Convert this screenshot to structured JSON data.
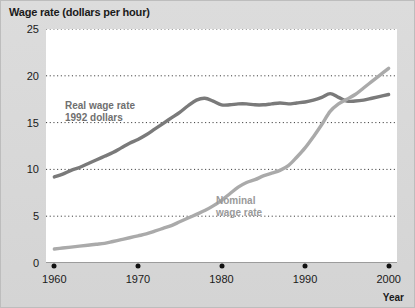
{
  "chart_data": {
    "type": "line",
    "title": "Wage rate (dollars per hour)",
    "xlabel": "Year",
    "ylabel": "Wage rate (dollars per hour)",
    "xlim": [
      1959,
      2001
    ],
    "ylim": [
      0,
      25
    ],
    "grid": true,
    "legend_position": "inline-annotations",
    "yticks": [
      0,
      5,
      10,
      15,
      20,
      25
    ],
    "ytick_labels": [
      "0",
      "5",
      "10",
      "15",
      "20",
      "25"
    ],
    "xticks": [
      1960,
      1970,
      1980,
      1990,
      2000
    ],
    "xtick_labels": [
      "1960",
      "1970",
      "1980",
      "1990",
      "2000"
    ],
    "annotations": [
      {
        "text": "Real wage rate\n1992 dollars",
        "line1": "Real wage rate",
        "line2": "1992 dollars",
        "color": "#6f6f6f"
      },
      {
        "text": "Nominal wage rate",
        "line1": "Nominal",
        "line2": "wage rate",
        "color": "#9a9a9a"
      }
    ],
    "series": [
      {
        "name": "Real wage rate 1992 dollars",
        "color": "#7a7a7a",
        "x": [
          1960,
          1961,
          1962,
          1963,
          1964,
          1965,
          1966,
          1967,
          1968,
          1969,
          1970,
          1971,
          1972,
          1973,
          1974,
          1975,
          1976,
          1977,
          1978,
          1979,
          1980,
          1981,
          1982,
          1983,
          1984,
          1985,
          1986,
          1987,
          1988,
          1989,
          1990,
          1991,
          1992,
          1993,
          1994,
          1995,
          1996,
          1997,
          1998,
          1999,
          2000
        ],
        "values": [
          9.2,
          9.5,
          9.9,
          10.2,
          10.6,
          11.0,
          11.4,
          11.8,
          12.3,
          12.8,
          13.2,
          13.7,
          14.3,
          14.9,
          15.5,
          16.1,
          16.8,
          17.4,
          17.6,
          17.3,
          16.9,
          16.9,
          17.0,
          17.0,
          16.9,
          16.9,
          17.0,
          17.1,
          17.0,
          17.1,
          17.2,
          17.4,
          17.7,
          18.1,
          17.7,
          17.3,
          17.3,
          17.4,
          17.6,
          17.8,
          18.0
        ]
      },
      {
        "name": "Nominal wage rate",
        "color": "#aaaaaa",
        "x": [
          1960,
          1961,
          1962,
          1963,
          1964,
          1965,
          1966,
          1967,
          1968,
          1969,
          1970,
          1971,
          1972,
          1973,
          1974,
          1975,
          1976,
          1977,
          1978,
          1979,
          1980,
          1981,
          1982,
          1983,
          1984,
          1985,
          1986,
          1987,
          1988,
          1989,
          1990,
          1991,
          1992,
          1993,
          1994,
          1995,
          1996,
          1997,
          1998,
          1999,
          2000
        ],
        "values": [
          1.5,
          1.6,
          1.7,
          1.8,
          1.9,
          2.0,
          2.1,
          2.3,
          2.5,
          2.7,
          2.9,
          3.1,
          3.4,
          3.7,
          4.0,
          4.4,
          4.8,
          5.2,
          5.6,
          6.1,
          6.7,
          7.4,
          8.1,
          8.6,
          8.9,
          9.3,
          9.6,
          9.9,
          10.4,
          11.3,
          12.3,
          13.5,
          14.8,
          16.2,
          17.0,
          17.5,
          18.0,
          18.7,
          19.4,
          20.1,
          20.8
        ]
      }
    ]
  }
}
